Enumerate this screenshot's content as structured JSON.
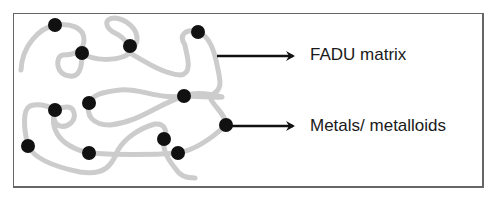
{
  "diagram": {
    "labels": {
      "matrix": "FADU matrix",
      "metals": "Metals/ metalloids"
    },
    "colors": {
      "chain": "#cccccc",
      "dot": "#111111",
      "arrow": "#111111",
      "frame": "#666666"
    },
    "dots": [
      {
        "x": 55,
        "y": 25
      },
      {
        "x": 82,
        "y": 53
      },
      {
        "x": 130,
        "y": 46
      },
      {
        "x": 198,
        "y": 32
      },
      {
        "x": 89,
        "y": 103
      },
      {
        "x": 55,
        "y": 110
      },
      {
        "x": 184,
        "y": 96
      },
      {
        "x": 28,
        "y": 146
      },
      {
        "x": 89,
        "y": 153
      },
      {
        "x": 164,
        "y": 139
      },
      {
        "x": 178,
        "y": 153
      },
      {
        "x": 226,
        "y": 125
      }
    ]
  }
}
